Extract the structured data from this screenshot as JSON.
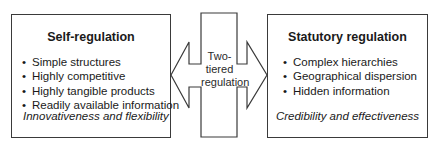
{
  "left_box": {
    "title": "Self-regulation",
    "items": [
      "Simple structures",
      "Highly competitive",
      "Highly tangible products",
      "Readily available information"
    ],
    "footer": "Innovativeness and flexibility"
  },
  "center": {
    "label_lines": [
      "Two-",
      "tiered",
      "regulation"
    ]
  },
  "right_box": {
    "title": "Statutory regulation",
    "items": [
      "Complex hierarchies",
      "Geographical dispersion",
      "Hidden information"
    ],
    "footer": "Credibility and effectiveness"
  },
  "bullet": "•"
}
